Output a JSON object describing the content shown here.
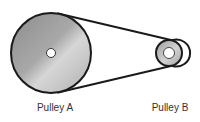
{
  "diagram": {
    "type": "belt-pulley-system",
    "pulleys": [
      {
        "id": "A",
        "label": "Pulley A",
        "cx": 51,
        "cy": 53,
        "r": 40,
        "hub_r": 4.5,
        "label_x": 55,
        "label_y": 102
      },
      {
        "id": "B",
        "label": "Pulley B",
        "cx": 169,
        "cy": 53,
        "r": 13,
        "hub_r": 5.5,
        "label_x": 170,
        "label_y": 102
      }
    ],
    "belt": {
      "top": {
        "x1": 58,
        "y1": 13.5,
        "x2": 172,
        "y2": 40.3
      },
      "bottom": {
        "x1": 58,
        "y1": 92.5,
        "x2": 172,
        "y2": 65.7
      }
    },
    "colors": {
      "stroke": "#1a1a1a",
      "pulley_light": "#d9d9d9",
      "pulley_dark": "#8f8f8f",
      "hub": "#ffffff",
      "label": "#333333"
    }
  }
}
